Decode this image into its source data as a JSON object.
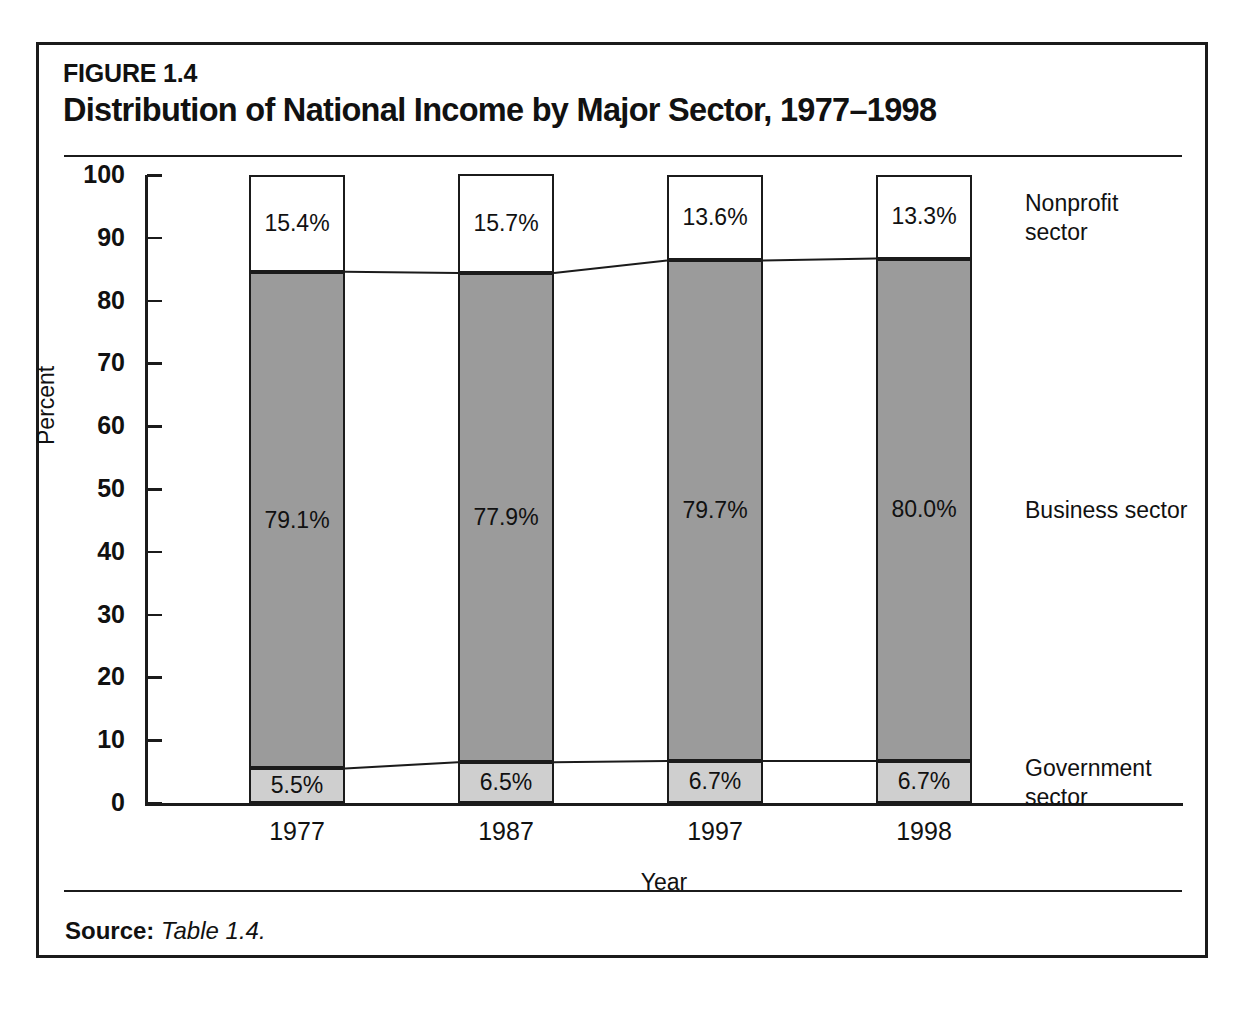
{
  "figure": {
    "number": "FIGURE 1.4",
    "title": "Distribution of National Income by Major Sector, 1977–1998",
    "source_label": "Source:",
    "source_value": "Table 1.4."
  },
  "chart_data": {
    "type": "bar",
    "subtype": "stacked-100-percent",
    "title": "Distribution of National Income by Major Sector, 1977–1998",
    "xlabel": "Year",
    "ylabel": "Percent",
    "ylim": [
      0,
      100
    ],
    "yticks": [
      0,
      10,
      20,
      30,
      40,
      50,
      60,
      70,
      80,
      90,
      100
    ],
    "ytick_labels": [
      "0",
      "10",
      "20",
      "30",
      "40",
      "50",
      "60",
      "70",
      "80",
      "90",
      "100"
    ],
    "grid": false,
    "legend_position": "right",
    "categories": [
      "1977",
      "1987",
      "1997",
      "1998"
    ],
    "series": [
      {
        "name": "Government sector",
        "legend_lines": [
          "Government",
          "sector"
        ],
        "color": "#cfcfcf",
        "values": [
          5.5,
          6.5,
          6.7,
          6.7
        ],
        "labels": [
          "5.5%",
          "6.5%",
          "6.7%",
          "6.7%"
        ]
      },
      {
        "name": "Business sector",
        "legend_lines": [
          "Business sector"
        ],
        "color": "#9b9b9b",
        "values": [
          79.1,
          77.9,
          79.7,
          80.0
        ],
        "labels": [
          "79.1%",
          "77.9%",
          "79.7%",
          "80.0%"
        ]
      },
      {
        "name": "Nonprofit sector",
        "legend_lines": [
          "Nonprofit",
          "sector"
        ],
        "color": "#ffffff",
        "values": [
          15.4,
          15.7,
          13.6,
          13.3
        ],
        "labels": [
          "15.4%",
          "15.7%",
          "13.6%",
          "13.3%"
        ]
      }
    ],
    "connector_lines": true,
    "border_color": "#1b1b1b"
  }
}
